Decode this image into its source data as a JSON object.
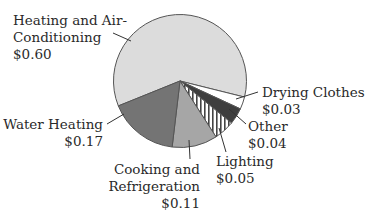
{
  "chart_data": {
    "type": "pie",
    "title": "",
    "unit": "$",
    "total": 1.0,
    "slices": [
      {
        "label": "Heating and Air-Conditioning",
        "label_lines": [
          "Heating and Air-",
          "Conditioning"
        ],
        "value": 0.6,
        "value_text": "$0.60",
        "color": "#dcdcdc",
        "pattern": "solid"
      },
      {
        "label": "Drying Clothes",
        "label_lines": [
          "Drying Clothes"
        ],
        "value": 0.03,
        "value_text": "$0.03",
        "color": "#ffffff",
        "pattern": "solid"
      },
      {
        "label": "Other",
        "label_lines": [
          "Other"
        ],
        "value": 0.04,
        "value_text": "$0.04",
        "color": "#3e3e3e",
        "pattern": "solid"
      },
      {
        "label": "Lighting",
        "label_lines": [
          "Lighting"
        ],
        "value": 0.05,
        "value_text": "$0.05",
        "color": "#ffffff",
        "pattern": "vertical-stripes"
      },
      {
        "label": "Cooking and Refrigeration",
        "label_lines": [
          "Cooking and",
          "Refrigeration"
        ],
        "value": 0.11,
        "value_text": "$0.11",
        "color": "#a6a6a6",
        "pattern": "solid"
      },
      {
        "label": "Water Heating",
        "label_lines": [
          "Water Heating"
        ],
        "value": 0.17,
        "value_text": "$0.17",
        "color": "#747474",
        "pattern": "solid"
      }
    ],
    "legend": "none (direct labels with leader lines)",
    "grid": false
  }
}
